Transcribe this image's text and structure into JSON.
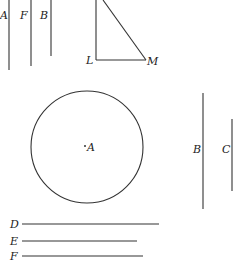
{
  "diagram": {
    "top_left_lines": [
      {
        "label": "A",
        "x": 9,
        "y1": 0,
        "y2": 70,
        "label_x": 0,
        "label_y": 19
      },
      {
        "label": "F",
        "x": 31,
        "y1": 0,
        "y2": 66,
        "label_x": 19,
        "label_y": 19
      },
      {
        "label": "B",
        "x": 51,
        "y1": 0,
        "y2": 56,
        "label_x": 40,
        "label_y": 19
      }
    ],
    "triangle": {
      "vertices": {
        "top": [
          103,
          0
        ],
        "L": [
          96,
          60
        ],
        "M": [
          146,
          60
        ]
      },
      "labels": {
        "L": "L",
        "M": "M"
      }
    },
    "circle": {
      "center_label": "A",
      "cx": 87,
      "cy": 147,
      "r": 56
    },
    "right_lines": [
      {
        "label": "B",
        "x": 203,
        "y1": 93,
        "y2": 209
      },
      {
        "label": "C",
        "x": 232,
        "y1": 119,
        "y2": 191
      }
    ],
    "bottom_lines": [
      {
        "label": "D",
        "y": 224,
        "x1": 22,
        "x2": 159
      },
      {
        "label": "E",
        "y": 241,
        "x1": 22,
        "x2": 137
      },
      {
        "label": "F",
        "y": 256,
        "x1": 22,
        "x2": 143
      }
    ],
    "colors": {
      "stroke": "#333333",
      "background": "#ffffff"
    }
  }
}
